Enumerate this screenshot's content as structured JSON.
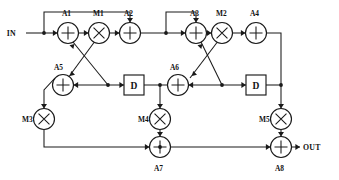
{
  "diagram": {
    "io": {
      "input_label": "IN",
      "output_label": "OUT"
    },
    "colors": {
      "line": "#1a1a1a",
      "background": "#ffffff",
      "label": "#111111"
    },
    "adders": [
      {
        "id": "A1",
        "label": "A1",
        "glyph": "plus",
        "cx": 68,
        "cy": 33,
        "r": 10.5,
        "label_x": 62,
        "label_y": 16
      },
      {
        "id": "A2",
        "label": "A2",
        "glyph": "plus",
        "cx": 130,
        "cy": 33,
        "r": 10.5,
        "label_x": 124,
        "label_y": 16
      },
      {
        "id": "A3",
        "label": "A3",
        "glyph": "plus",
        "cx": 196,
        "cy": 33,
        "r": 10.5,
        "label_x": 190,
        "label_y": 16
      },
      {
        "id": "A4",
        "label": "A4",
        "glyph": "plus",
        "cx": 256,
        "cy": 33,
        "r": 10.5,
        "label_x": 250,
        "label_y": 16
      },
      {
        "id": "A5",
        "label": "A5",
        "glyph": "plus",
        "cx": 63,
        "cy": 85,
        "r": 10.5,
        "label_x": 54,
        "label_y": 70
      },
      {
        "id": "A6",
        "label": "A6",
        "glyph": "plus",
        "cx": 178,
        "cy": 85,
        "r": 10.5,
        "label_x": 170,
        "label_y": 70
      },
      {
        "id": "A7",
        "label": "A7",
        "glyph": "plus",
        "cx": 160,
        "cy": 147,
        "r": 10.5,
        "label_x": 154,
        "label_y": 171
      },
      {
        "id": "A8",
        "label": "A8",
        "glyph": "plus",
        "cx": 281,
        "cy": 147,
        "r": 10.5,
        "label_x": 275,
        "label_y": 171
      }
    ],
    "multipliers": [
      {
        "id": "M1",
        "label": "M1",
        "glyph": "times",
        "cx": 99,
        "cy": 33,
        "r": 10.5,
        "label_x": 93,
        "label_y": 16
      },
      {
        "id": "M2",
        "label": "M2",
        "glyph": "times",
        "cx": 222,
        "cy": 33,
        "r": 10.5,
        "label_x": 216,
        "label_y": 16
      },
      {
        "id": "M3",
        "label": "M3",
        "glyph": "times",
        "cx": 44,
        "cy": 119,
        "r": 10.5,
        "label_x": 22,
        "label_y": 122
      },
      {
        "id": "M4",
        "label": "M4",
        "glyph": "times",
        "cx": 160,
        "cy": 119,
        "r": 10.5,
        "label_x": 138,
        "label_y": 122
      },
      {
        "id": "M5",
        "label": "M5",
        "glyph": "times",
        "cx": 281,
        "cy": 119,
        "r": 10.5,
        "label_x": 259,
        "label_y": 122
      }
    ],
    "delays": [
      {
        "id": "D1",
        "label": "D",
        "x": 124,
        "y": 75,
        "w": 20,
        "h": 20
      },
      {
        "id": "D2",
        "label": "D",
        "x": 246,
        "y": 75,
        "w": 20,
        "h": 20
      }
    ],
    "io_ports": [
      {
        "id": "in-port",
        "label": "IN",
        "x": 16,
        "y": 36,
        "arrow_x": 46,
        "arrow_y": 33
      },
      {
        "id": "out-port",
        "label": "OUT",
        "x": 303,
        "y": 150,
        "arrow_x": 300,
        "arrow_y": 147
      }
    ],
    "junctions": [
      {
        "id": "j-in",
        "cx": 44,
        "cy": 33
      },
      {
        "id": "j-a2out",
        "cx": 166,
        "cy": 33
      },
      {
        "id": "j-a5right",
        "cx": 108,
        "cy": 85
      },
      {
        "id": "j-d1out",
        "cx": 160,
        "cy": 85
      },
      {
        "id": "j-a6right",
        "cx": 222,
        "cy": 85
      },
      {
        "id": "j-d2out",
        "cx": 281,
        "cy": 85
      },
      {
        "id": "j-a7in",
        "cx": 160,
        "cy": 147
      }
    ],
    "wires": [
      {
        "id": "w-in-a1",
        "d": "M 26 33 L 57.5 33"
      },
      {
        "id": "w-a1-m1",
        "d": "M 78.5 33 L 88.5 33"
      },
      {
        "id": "w-m1-a2",
        "d": "M 109.5 33 L 119.5 33"
      },
      {
        "id": "w-a2-a3",
        "d": "M 140.5 33 L 185.5 33"
      },
      {
        "id": "w-a3-m2",
        "d": "M 206.5 33 L 211.5 33"
      },
      {
        "id": "w-m2-a4",
        "d": "M 232.5 33 L 245.5 33"
      },
      {
        "id": "w-fb1-top",
        "d": "M 44 33 L 44 12 L 130 12 L 130 22.5"
      },
      {
        "id": "w-fb2-top",
        "d": "M 166 33 L 166 12 L 196 12 L 196 22.5"
      },
      {
        "id": "w-a4-down",
        "d": "M 266.5 33 L 281 33 L 281 85"
      },
      {
        "id": "w-m1-a5diag",
        "d": "M 94 42.5 L 68 78"
      },
      {
        "id": "w-a5j-a1diag",
        "d": "M 108 85 L 73 42"
      },
      {
        "id": "w-m2-a6diag",
        "d": "M 217 42.5 L 190 78"
      },
      {
        "id": "w-a6j-a3diag",
        "d": "M 222 85 L 201 42"
      },
      {
        "id": "w-a5-right",
        "d": "M 73.5 85 L 124 85"
      },
      {
        "id": "w-d1-out",
        "d": "M 144 85 L 178 85"
      },
      {
        "id": "w-a6-right",
        "d": "M 188.5 85 L 246 85"
      },
      {
        "id": "w-d2-out",
        "d": "M 266 85 L 281 85"
      },
      {
        "id": "w-a5-m3",
        "d": "M 55 78 L 44 90 L 44 108.5"
      },
      {
        "id": "w-d1j-m4",
        "d": "M 160 85 L 160 108.5"
      },
      {
        "id": "w-d2j-m5",
        "d": "M 281 85 L 281 108.5"
      },
      {
        "id": "w-m3-bottom",
        "d": "M 44 129.5 L 44 147 L 149.5 147"
      },
      {
        "id": "w-m4-a7",
        "d": "M 160 129.5 L 160 136.5"
      },
      {
        "id": "w-a7-a8",
        "d": "M 170.5 147 L 270.5 147"
      },
      {
        "id": "w-m5-a8",
        "d": "M 281 129.5 L 281 136.5"
      },
      {
        "id": "w-a8-out",
        "d": "M 291.5 147 L 300 147"
      }
    ],
    "arrows": [
      {
        "id": "ar-in",
        "x": 57.5,
        "y": 33,
        "dir": "right"
      },
      {
        "id": "ar-a1m1",
        "x": 88.5,
        "y": 33,
        "dir": "right"
      },
      {
        "id": "ar-m1a2",
        "x": 119.5,
        "y": 33,
        "dir": "right"
      },
      {
        "id": "ar-a2a3",
        "x": 185.5,
        "y": 33,
        "dir": "right"
      },
      {
        "id": "ar-a3m2",
        "x": 211.5,
        "y": 33,
        "dir": "right"
      },
      {
        "id": "ar-m2a4",
        "x": 245.5,
        "y": 33,
        "dir": "right"
      },
      {
        "id": "ar-fb1",
        "x": 130,
        "y": 22.5,
        "dir": "down"
      },
      {
        "id": "ar-fb2",
        "x": 196,
        "y": 22.5,
        "dir": "down"
      },
      {
        "id": "ar-a5diag",
        "x": 70,
        "y": 76,
        "dir": "downleft"
      },
      {
        "id": "ar-a1diag",
        "x": 74.5,
        "y": 44,
        "dir": "upright"
      },
      {
        "id": "ar-a6diag",
        "x": 192,
        "y": 76,
        "dir": "downleft"
      },
      {
        "id": "ar-a3diag",
        "x": 202.5,
        "y": 44,
        "dir": "upright"
      },
      {
        "id": "ar-a5left",
        "x": 73.5,
        "y": 85,
        "dir": "left"
      },
      {
        "id": "ar-d1in",
        "x": 124,
        "y": 85,
        "dir": "right"
      },
      {
        "id": "ar-a6left",
        "x": 188.5,
        "y": 85,
        "dir": "left"
      },
      {
        "id": "ar-d2in",
        "x": 246,
        "y": 85,
        "dir": "right"
      },
      {
        "id": "ar-m3in",
        "x": 44,
        "y": 108.5,
        "dir": "down"
      },
      {
        "id": "ar-m4in",
        "x": 160,
        "y": 108.5,
        "dir": "down"
      },
      {
        "id": "ar-m5in",
        "x": 281,
        "y": 108.5,
        "dir": "down"
      },
      {
        "id": "ar-a7left",
        "x": 149.5,
        "y": 147,
        "dir": "right"
      },
      {
        "id": "ar-a7top",
        "x": 160,
        "y": 136.5,
        "dir": "down"
      },
      {
        "id": "ar-a8left",
        "x": 270.5,
        "y": 147,
        "dir": "right"
      },
      {
        "id": "ar-a8top",
        "x": 281,
        "y": 136.5,
        "dir": "down"
      },
      {
        "id": "ar-out",
        "x": 300,
        "y": 147,
        "dir": "right"
      }
    ]
  }
}
